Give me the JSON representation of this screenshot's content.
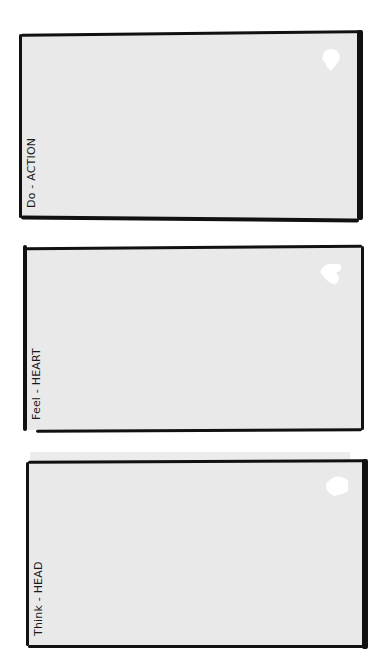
{
  "cards": [
    {
      "label": "Do - ACTION",
      "icon": "hand-icon",
      "fill": "#e9e9e9"
    },
    {
      "label": "Feel - HEART",
      "icon": "heart-icon",
      "fill": "#e9e9e9"
    },
    {
      "label": "Think - HEAD",
      "icon": "head-icon",
      "fill": "#e9e9e9"
    }
  ],
  "colors": {
    "background": "#ffffff",
    "card": "#e9e9e9",
    "stroke": "#111111",
    "icon": "#ffffff"
  }
}
